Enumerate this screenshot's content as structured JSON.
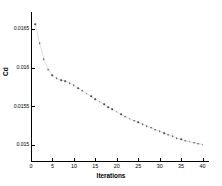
{
  "chart_data": {
    "type": "scatter",
    "title": "",
    "xlabel": "Iterations",
    "ylabel": "Cd",
    "xlim": [
      0,
      41.5
    ],
    "ylim": [
      0.01478,
      0.01672
    ],
    "grid": false,
    "legend": null,
    "xticks": [
      0,
      5,
      10,
      15,
      20,
      25,
      30,
      35,
      40
    ],
    "xtick_labels": [
      "0",
      "5",
      "10",
      "15",
      "20",
      "25",
      "30",
      "35",
      "40"
    ],
    "yticks": [
      0.015,
      0.0155,
      0.016,
      0.0165
    ],
    "ytick_labels": [
      "0.015",
      "0.0155",
      "0.016",
      "0.0165"
    ],
    "marker": "dot",
    "marker_color": "#4a4a4a",
    "line_color": "#c8c8c8",
    "x": [
      1,
      2,
      3,
      4,
      5,
      6,
      7,
      8,
      9,
      10,
      11,
      12,
      13,
      14,
      15,
      16,
      17,
      18,
      19,
      20,
      21,
      22,
      23,
      24,
      25,
      26,
      27,
      28,
      29,
      30,
      31,
      32,
      33,
      34,
      35,
      36,
      37,
      38,
      39,
      40
    ],
    "values": [
      0.01656,
      0.01632,
      0.01611,
      0.015975,
      0.0159,
      0.015862,
      0.01584,
      0.015828,
      0.0158,
      0.01577,
      0.015735,
      0.0157,
      0.015665,
      0.01563,
      0.015595,
      0.01556,
      0.015525,
      0.015492,
      0.01546,
      0.015428,
      0.015398,
      0.015368,
      0.01534,
      0.015315,
      0.015292,
      0.015268,
      0.015245,
      0.015222,
      0.0152,
      0.015178,
      0.015155,
      0.015132,
      0.01511,
      0.01509,
      0.015072,
      0.015056,
      0.015042,
      0.01503,
      0.015018,
      0.015005
    ]
  }
}
